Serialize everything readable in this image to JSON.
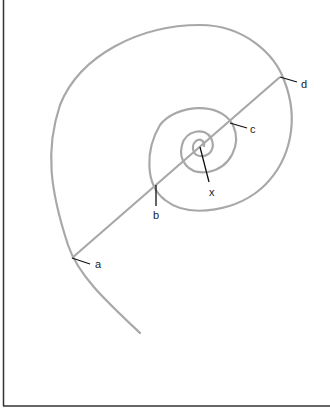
{
  "diagram": {
    "type": "spiral",
    "labels": {
      "a": "a",
      "b": "b",
      "c": "c",
      "d": "d",
      "x": "x"
    },
    "colors": {
      "spiral": "#a8a8a8",
      "leader": "#111111",
      "frame": "#333333",
      "background": "#ffffff"
    }
  }
}
